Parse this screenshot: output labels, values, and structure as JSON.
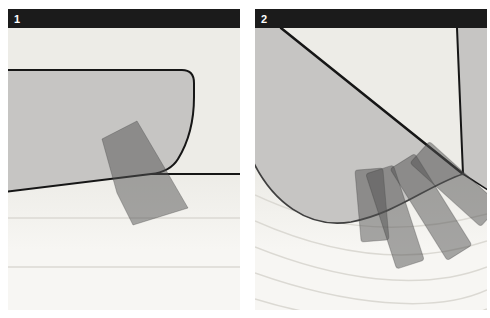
{
  "figure": {
    "panels": [
      {
        "number": "1"
      },
      {
        "number": "2"
      }
    ],
    "colors": {
      "page_bg": "#ffffff",
      "bar": "#1b1b1b",
      "number": "#ffffff",
      "panel_bg_top": "#edece7",
      "panel_bg_bottom": "#f7f6f3",
      "hull": "#c6c5c3",
      "outline": "#161616",
      "curve": "#3f3f3f",
      "tape": "rgba(82,82,82,0.5)",
      "tape_edge": "rgba(60,60,60,0.3)",
      "ripple": "#dbd9d3"
    }
  }
}
